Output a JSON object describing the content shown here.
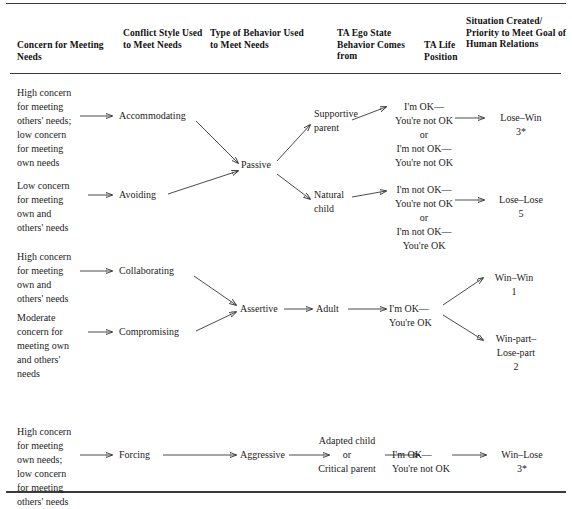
{
  "figure": {
    "type": "flow-diagram",
    "rules": [
      "top-rule",
      "header-rule",
      "bottom-rule"
    ],
    "columns": [
      {
        "key": "concern",
        "header": "Concern for\nMeeting Needs"
      },
      {
        "key": "style",
        "header": "Conflict Style\nUsed to Meet\nNeeds"
      },
      {
        "key": "behavior",
        "header": "Type of Behavior\nUsed to Meet\nNeeds"
      },
      {
        "key": "ego",
        "header": "TA Ego State\nBehavior\nComes from"
      },
      {
        "key": "life",
        "header": "TA Life\nPosition"
      },
      {
        "key": "situation",
        "header": "Situation Created/\nPriority to Meet\nGoal of Human\nRelations"
      }
    ],
    "blocks": [
      {
        "name": "passive-block",
        "behavior": "Passive",
        "branches": [
          {
            "concern": "High concern\nfor meeting\nothers' needs;\nlow concern\nfor meeting\nown needs",
            "style": "Accommodating",
            "ego": "Supportive\nparent",
            "life": "I'm OK—\nYou're not OK\nor\nI'm not OK—\nYou're not OK",
            "situation": "Lose–Win\n3*"
          },
          {
            "concern": "Low concern\nfor meeting\nown and\nothers' needs",
            "style": "Avoiding",
            "ego": "Natural\nchild",
            "life": "I'm not OK—\nYou're not OK\nor\nI'm not OK—\nYou're OK",
            "situation": "Lose–Lose\n5"
          }
        ]
      },
      {
        "name": "assertive-block",
        "behavior": "Assertive",
        "branches": [
          {
            "concern": "High concern\nfor meeting\nown and\nothers' needs",
            "style": "Collaborating",
            "ego": "Adult",
            "life": "I'm OK—\nYou're OK",
            "situation": "Win–Win\n1"
          },
          {
            "concern": "Moderate\nconcern for\nmeeting own\nand others'\nneeds",
            "style": "Compromising",
            "ego": "Adult",
            "life": "I'm OK—\nYou're OK",
            "situation": "Win-part–\nLose-part\n2"
          }
        ]
      },
      {
        "name": "aggressive-block",
        "behavior": "Aggressive",
        "branches": [
          {
            "concern": "High concern\nfor meeting\nown needs;\nlow concern\nfor meeting\nothers' needs",
            "style": "Forcing",
            "ego": "Adapted child\nor\nCritical parent",
            "life": "I'm OK—\nYou're not OK",
            "situation": "Win–Lose\n3*"
          }
        ]
      }
    ],
    "nodes": {
      "passive": "Passive",
      "assertive": "Assertive",
      "aggressive": "Aggressive",
      "adult": "Adult"
    },
    "colors": {
      "ink": "#1a1a1a",
      "rule": "#3a3a3a",
      "arrow": "#2b2b2b"
    }
  }
}
